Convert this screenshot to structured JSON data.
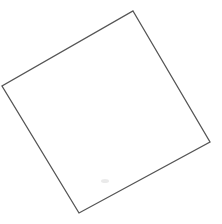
{
  "canvas": {
    "width": 222,
    "height": 224,
    "background_color": "#ffffff",
    "title": "Rotated square outline"
  },
  "shape": {
    "name": "square",
    "description": "Hand-drawn rotated square outline (quadrilateral)",
    "fill": "none",
    "fill_color": "#ffffff",
    "stroke_color": "#555555",
    "stroke_width": 1.3,
    "rotation_degrees": -30,
    "points_string": "133,11 210,142 79,213 2,86",
    "vertices": [
      {
        "label": "top",
        "x": 133,
        "y": 11
      },
      {
        "label": "right",
        "x": 210,
        "y": 142
      },
      {
        "label": "bottom",
        "x": 79,
        "y": 213
      },
      {
        "label": "left",
        "x": 2,
        "y": 86
      }
    ]
  },
  "artifacts": [
    {
      "name": "faint-smudge",
      "x": 105,
      "y": 181,
      "rx": 4,
      "ry": 2
    }
  ]
}
